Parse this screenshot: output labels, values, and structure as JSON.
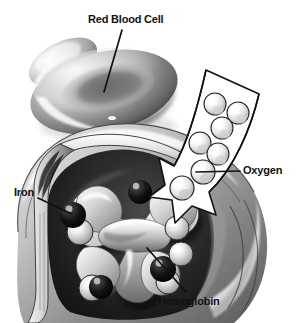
{
  "figure": {
    "background_color": "#ffffff",
    "ink_color": "#111111",
    "style": "grayscale airbrush biomedical illustration"
  },
  "labels": {
    "red_blood_cell": "Red Blood Cell",
    "oxygen": "Oxygen",
    "iron": "Iron",
    "hemoglobin": "Hemoglobin"
  },
  "structures": {
    "red_blood_cell_front": "biconcave disc cell, front",
    "red_blood_cell_back": "biconcave disc cell, behind",
    "cell_cutaway": "cut-open cell interior",
    "hemoglobin_molecule": "H-shaped hemoglobin protein",
    "oxygen_arrow": "arrow showing oxygen entering cell"
  },
  "counts": {
    "iron_atoms": 4,
    "oxygen_molecules_in_arrow": 9
  },
  "palette": {
    "white": "#ffffff",
    "light_gray": "#d8d8d8",
    "mid_gray": "#8c8c8c",
    "dark_gray": "#3a3a3a",
    "near_black": "#141414",
    "outline": "#111111"
  },
  "leader_lines": {
    "red_blood_cell": "from text down-left into front cell surface",
    "oxygen": "from text left to an oxygen sphere inside the arrow",
    "iron": "from text right-down to an iron atom sphere",
    "hemoglobin": "from text up-left to the hemoglobin molecule arm"
  }
}
